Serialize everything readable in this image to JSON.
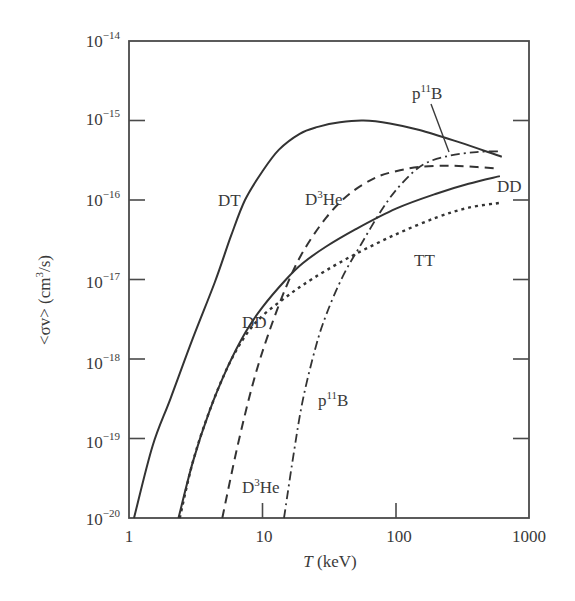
{
  "chart_data": {
    "type": "line",
    "title": "",
    "xlabel": "T (keV)",
    "ylabel": "<σv> (cm³/s)",
    "xscale": "log",
    "yscale": "log",
    "xlim": [
      1,
      1000
    ],
    "ylim": [
      1e-20,
      1e-14
    ],
    "x_ticks": [
      "1",
      "10",
      "100",
      "1000"
    ],
    "y_ticks": [
      "10^-20",
      "10^-19",
      "10^-18",
      "10^-17",
      "10^-16",
      "10^-15",
      "10^-14"
    ],
    "grid": false,
    "legend": "inline labels",
    "series": [
      {
        "name": "DT",
        "style": "solid",
        "x": [
          1.09,
          1.5,
          2.05,
          3.0,
          4.4,
          5.8,
          7.4,
          10,
          13.3,
          19,
          26,
          38,
          57,
          90,
          150,
          300,
          620
        ],
        "y": [
          1e-20,
          8e-20,
          3.2e-19,
          1.8e-18,
          9.3e-18,
          3.5e-17,
          1e-16,
          2.3e-16,
          4.3e-16,
          6.8e-16,
          8.3e-16,
          9.5e-16,
          1e-15,
          9.2e-16,
          7.6e-16,
          5.3e-16,
          3.5e-16
        ]
      },
      {
        "name": "DD",
        "style": "solid",
        "x": [
          2.35,
          3.0,
          4.0,
          5.5,
          7.5,
          10,
          15,
          20,
          30,
          50,
          100,
          200,
          350,
          600
        ],
        "y": [
          1e-20,
          5e-20,
          2.2e-19,
          8e-19,
          2.2e-18,
          4.5e-18,
          1e-17,
          1.6e-17,
          2.6e-17,
          4.3e-17,
          7.8e-17,
          1.2e-16,
          1.6e-16,
          2e-16
        ]
      },
      {
        "name": "TT",
        "style": "dotted",
        "x": [
          2.4,
          3.0,
          4.0,
          5.5,
          7.5,
          10,
          15,
          20,
          30,
          50,
          100,
          200,
          350,
          600
        ],
        "y": [
          1e-20,
          5e-20,
          2.2e-19,
          8e-19,
          2e-18,
          3.5e-18,
          6e-18,
          8.5e-18,
          1.3e-17,
          2.1e-17,
          3.7e-17,
          6e-17,
          8e-17,
          9.2e-17
        ]
      },
      {
        "name": "D3He",
        "style": "dashed",
        "x": [
          5.0,
          6.5,
          8.5,
          11,
          15,
          20,
          30,
          45,
          70,
          100,
          150,
          250,
          400,
          550
        ],
        "y": [
          1e-20,
          8e-20,
          5e-19,
          2e-18,
          8e-18,
          2.2e-17,
          6e-17,
          1.2e-16,
          1.9e-16,
          2.3e-16,
          2.6e-16,
          2.7e-16,
          2.6e-16,
          2.5e-16
        ]
      },
      {
        "name": "p11B",
        "style": "dashdot",
        "x": [
          14.5,
          17,
          20,
          25,
          30,
          40,
          55,
          80,
          110,
          160,
          250,
          400,
          600
        ],
        "y": [
          1e-20,
          6e-20,
          3e-19,
          1.4e-18,
          3.6e-18,
          1.1e-17,
          2.8e-17,
          8e-17,
          1.6e-16,
          2.8e-16,
          3.6e-16,
          4e-16,
          4.1e-16
        ]
      }
    ],
    "annotations": [
      {
        "text": "DT",
        "x": 4.6,
        "y": 1e-16
      },
      {
        "text": "D3He",
        "x": 28,
        "y": 1e-16
      },
      {
        "text": "p11B",
        "x": 175,
        "y": 1.3e-15
      },
      {
        "text": "DD",
        "x": 540,
        "y": 1.4e-16
      },
      {
        "text": "TT",
        "x": 180,
        "y": 1.8e-17
      },
      {
        "text": "DD",
        "x": 8.5,
        "y": 3.3e-18
      },
      {
        "text": "p11B",
        "x": 45,
        "y": 4.5e-19
      },
      {
        "text": "D3He",
        "x": 19,
        "y": 1e-19
      }
    ]
  },
  "labels": {
    "xlabel_italic": "T",
    "xlabel_rest": " (keV)",
    "ylabel_main": "<σv> (cm",
    "ylabel_sup": "3",
    "ylabel_end": "/s)",
    "x_ticks": [
      "1",
      "10",
      "100",
      "1000"
    ],
    "y_tick_base": "10",
    "y_tick_exps": [
      "−14",
      "−15",
      "−16",
      "−17",
      "−18",
      "−19",
      "−20"
    ],
    "DT": "DT",
    "DD": "DD",
    "TT": "TT",
    "D": "D",
    "He": "He",
    "p": "p",
    "B": "B",
    "sup3": "3",
    "sup11": "11"
  }
}
